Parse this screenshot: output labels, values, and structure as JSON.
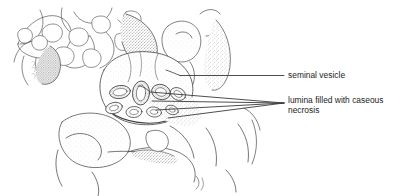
{
  "figure": {
    "kind": "medical-illustration",
    "background_color": "#ffffff",
    "ink_color": "#3a3a3a",
    "label_color": "#1b1b1b"
  },
  "labels": [
    {
      "id": "seminal-vesicle",
      "text": "seminal vesicle",
      "leader": "single-horizontal-line"
    },
    {
      "id": "lumina",
      "text": "lumina filled with caseous\nnecrosis",
      "leader": "fan-of-four-lines"
    }
  ],
  "drawing": {
    "title": "seminal vesicle cross-section",
    "features": [
      "trabecular bone / prostatic tissue mass upper left",
      "seminal vesicle body, center",
      "cluster of dilated lumina with caseous contents",
      "stippled connective tissue",
      "lower soft tissue lobes"
    ],
    "lumina_count": 8
  }
}
